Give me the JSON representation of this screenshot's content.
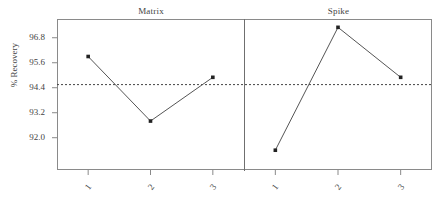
{
  "chart_data": {
    "type": "line",
    "title": "",
    "xlabel": "",
    "ylabel": "% Recovery",
    "ylim": [
      90.45,
      97.7
    ],
    "yticks": [
      "92.0",
      "93.2",
      "94.4",
      "95.6",
      "96.8"
    ],
    "ytick_values": [
      92.0,
      93.2,
      94.4,
      95.6,
      96.8
    ],
    "xticks": [
      "1",
      "2",
      "3"
    ],
    "grid": false,
    "legend": false,
    "panels": [
      {
        "name": "Matrix",
        "categories": [
          "1",
          "2",
          "3"
        ],
        "values": [
          95.9,
          92.8,
          94.9
        ]
      },
      {
        "name": "Spike",
        "categories": [
          "1",
          "2",
          "3"
        ],
        "values": [
          91.4,
          97.3,
          94.9
        ]
      }
    ],
    "reference_line": {
      "value": 94.55,
      "style": "dotted",
      "label": ""
    },
    "colors": {
      "line": "#555555",
      "marker": "#222222",
      "frame": "#8a8a8a",
      "reference": "#444444",
      "text": "#444444"
    }
  },
  "axis": {
    "ylabel": "% Recovery"
  },
  "panel_titles": {
    "left": "Matrix",
    "right": "Spike"
  }
}
